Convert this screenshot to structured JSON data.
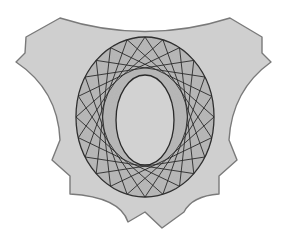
{
  "diagram": {
    "title": "",
    "colors": {
      "background": "#ffffff",
      "shield_fill": "#cfcfcf",
      "shield_stroke": "#7a7a7a",
      "ring_fill": "#b4b4b4",
      "chord_stroke": "#2a2a2a",
      "inner_fill": "#d2d2d2"
    },
    "outer_ellipse": {
      "cx": 145,
      "cy": 117,
      "rx": 69,
      "ry": 80
    },
    "inner_ellipse": {
      "cx": 145,
      "cy": 120,
      "rx": 29,
      "ry": 45
    },
    "chords": {
      "points": 24,
      "skip": 7
    }
  }
}
